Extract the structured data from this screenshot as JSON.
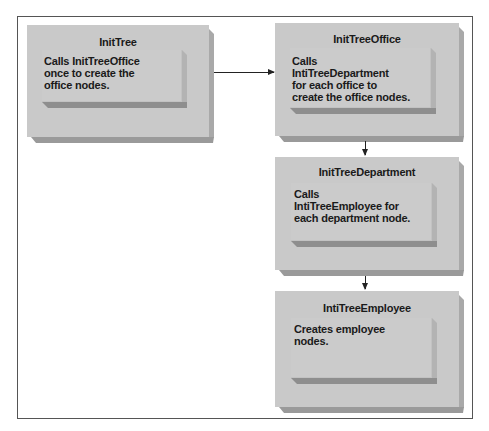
{
  "diagram": {
    "nodes": [
      {
        "id": "init-tree",
        "title": "InitTree",
        "description": "Calls InitTreeOffice\nonce to create the\noffice nodes."
      },
      {
        "id": "init-tree-office",
        "title": "InitTreeOffice",
        "description": "Calls\nIntiTreeDepartment\nfor each office to\ncreate the office nodes."
      },
      {
        "id": "init-tree-department",
        "title": "InitTreeDepartment",
        "description": "Calls\nIntiTreeEmployee for\neach department node."
      },
      {
        "id": "inti-tree-employee",
        "title": "IntiTreeEmployee",
        "description": "Creates employee\nnodes."
      }
    ],
    "edges": [
      {
        "from": "InitTree",
        "to": "InitTreeOffice"
      },
      {
        "from": "InitTreeOffice",
        "to": "InitTreeDepartment"
      },
      {
        "from": "InitTreeDepartment",
        "to": "IntiTreeEmployee"
      }
    ],
    "colors": {
      "box_face": "#c9c9c9",
      "box_shadow": "#9a9a9a",
      "text": "#1a1a1a",
      "frame": "#555555",
      "arrow": "#222222"
    }
  }
}
